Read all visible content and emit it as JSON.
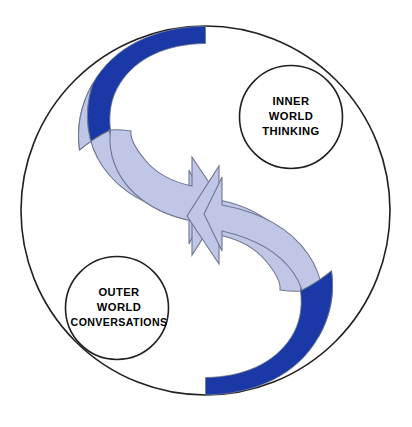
{
  "diagram": {
    "canvas": {
      "width": 412,
      "height": 427,
      "background": "#ffffff"
    },
    "colors": {
      "dark_blue": "#1a38a6",
      "light_blue": "#bfc6e6",
      "outline": "#231f20",
      "band_outline": "#6f7791",
      "white": "#ffffff"
    },
    "outer_circle": {
      "name": "outer-boundary-circle",
      "cx": 205.5,
      "cy": 210.5,
      "r": 184.5,
      "stroke": "#231f20",
      "fill": "#ffffff"
    },
    "labels": [
      {
        "id": "inner-world",
        "cx": 291,
        "cy": 117,
        "r": 51.5,
        "lines": [
          "INNER",
          "WORLD",
          "THINKING"
        ]
      },
      {
        "id": "outer-world",
        "cx": 117,
        "cy": 308,
        "r": 51.5,
        "lines": [
          "OUTER",
          "WORLD",
          "CONVERSATIONS"
        ]
      }
    ],
    "bands": [
      {
        "id": "top-band-dark",
        "color": "#1a38a6",
        "description": "dark blue crescent at top-left of the ring"
      },
      {
        "id": "upper-arrow-light",
        "color": "#bfc6e6",
        "description": "light blue curved arrow sweeping from upper-left down to the centre, arrowhead pointing right"
      },
      {
        "id": "lower-arrow-light",
        "color": "#bfc6e6",
        "description": "light blue curved arrow sweeping from lower-right up to the centre, arrowhead pointing left"
      },
      {
        "id": "bottom-band-dark",
        "color": "#1a38a6",
        "description": "dark blue crescent at bottom-right of the ring"
      }
    ]
  }
}
